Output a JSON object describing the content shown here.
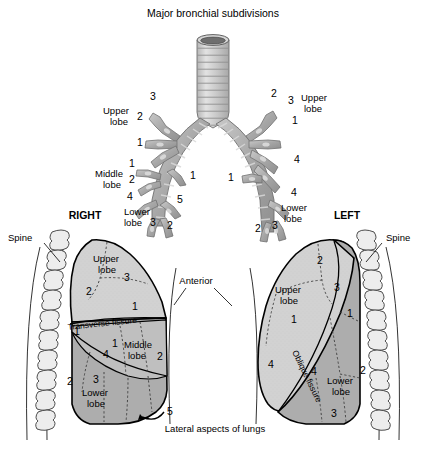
{
  "figure": {
    "title": "Major bronchial subdivisions",
    "caption": "Lateral aspects of lungs",
    "type": "anatomical-diagram"
  },
  "colors": {
    "background": "#ffffff",
    "outline": "#000000",
    "upper_lobe_fill": "#d2d2d2",
    "lower_lobe_fill": "#adadad",
    "middle_lobe_fill": "#bfbfbf",
    "bronchi_fill": "#a9a9a9",
    "bronchi_light": "#cfcfcf",
    "trachea_lumen": "#6e6e6e",
    "vertebra_fill": "#ededed",
    "fissure_stroke": "#3a3a3a"
  },
  "bronchial_tree": {
    "trachea_label": "trachea",
    "right_side": {
      "upper_lobe": {
        "label_line1": "Upper",
        "label_line2": "lobe",
        "segments": [
          "3",
          "2",
          "1"
        ]
      },
      "middle_lobe": {
        "label_line1": "Middle",
        "label_line2": "lobe",
        "segments": [
          "1",
          "2"
        ]
      },
      "lower_lobe": {
        "label_line1": "Lower",
        "label_line2": "lobe",
        "segments": [
          "4",
          "5",
          "3",
          "2",
          "1"
        ]
      }
    },
    "left_side": {
      "upper_lobe": {
        "label_line1": "Upper",
        "label_line2": "lobe",
        "segments": [
          "2",
          "3",
          "1",
          "4"
        ]
      },
      "lower_lobe": {
        "label_line1": "Lower",
        "label_line2": "lobe",
        "segments": [
          "1",
          "4",
          "2",
          "3"
        ]
      }
    }
  },
  "lungs": {
    "right": {
      "side_label": "RIGHT",
      "spine_label": "Spine",
      "upper_lobe": {
        "label_line1": "Upper",
        "label_line2": "lobe",
        "segments": [
          "3",
          "2",
          "1"
        ]
      },
      "middle_lobe": {
        "label_line1": "Middle",
        "label_line2": "lobe",
        "segments": [
          "1",
          "2"
        ]
      },
      "lower_lobe": {
        "label_line1": "Lower",
        "label_line2": "lobe",
        "segments": [
          "1",
          "4",
          "2",
          "3",
          "5"
        ]
      },
      "fissure_label": "Transverse fissure"
    },
    "left": {
      "side_label": "LEFT",
      "spine_label": "Spine",
      "upper_lobe": {
        "label_line1": "Upper",
        "label_line2": "lobe",
        "segments": [
          "2",
          "3",
          "1",
          "4"
        ]
      },
      "lower_lobe": {
        "label_line1": "Lower",
        "label_line2": "lobe",
        "segments": [
          "1",
          "4",
          "2",
          "3"
        ]
      },
      "fissure_label": "Oblique fissure"
    },
    "anterior_label": "Anterior"
  }
}
